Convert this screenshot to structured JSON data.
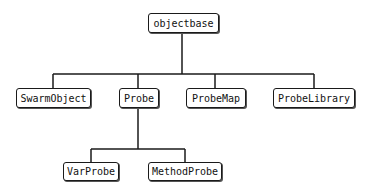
{
  "diagram": {
    "type": "class-hierarchy-tree",
    "line_color": "#1a1a1a",
    "nodes": [
      {
        "id": "objectbase",
        "label": "objectbase",
        "x": 148,
        "y": 13,
        "w": 71,
        "h": 20
      },
      {
        "id": "swarmobject",
        "label": "SwarmObject",
        "x": 16,
        "y": 88,
        "w": 75,
        "h": 20
      },
      {
        "id": "probe",
        "label": "Probe",
        "x": 119,
        "y": 88,
        "w": 40,
        "h": 20
      },
      {
        "id": "probemap",
        "label": "ProbeMap",
        "x": 186,
        "y": 88,
        "w": 60,
        "h": 20
      },
      {
        "id": "probelibrary",
        "label": "ProbeLibrary",
        "x": 273,
        "y": 88,
        "w": 82,
        "h": 20
      },
      {
        "id": "varprobe",
        "label": "VarProbe",
        "x": 63,
        "y": 162,
        "w": 56,
        "h": 19
      },
      {
        "id": "methodprobe",
        "label": "MethodProbe",
        "x": 148,
        "y": 162,
        "w": 74,
        "h": 19
      }
    ],
    "edges": [
      {
        "parent": "objectbase",
        "children": [
          "swarmobject",
          "probe",
          "probemap",
          "probelibrary"
        ]
      },
      {
        "parent": "probe",
        "children": [
          "varprobe",
          "methodprobe"
        ]
      }
    ]
  }
}
